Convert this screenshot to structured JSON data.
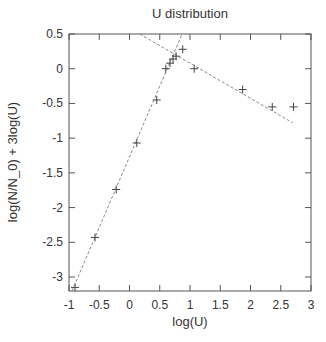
{
  "chart_data": {
    "type": "scatter",
    "title": "U distribution",
    "xlabel": "log(U)",
    "ylabel": "log(N/N_0) + 3log(U)",
    "xlim": [
      -1,
      3
    ],
    "ylim": [
      -3.2,
      0.5
    ],
    "xticks": [
      -1,
      -0.5,
      0,
      0.5,
      1,
      1.5,
      2,
      2.5,
      3
    ],
    "xtick_labels": [
      "-1",
      "-0.5",
      "0",
      "0.5",
      "1",
      "1.5",
      "2",
      "2.5",
      "3"
    ],
    "yticks": [
      0.5,
      0,
      -0.5,
      -1,
      -1.5,
      -2,
      -2.5,
      -3
    ],
    "ytick_labels": [
      "0.5",
      "0",
      "-0.5",
      "-1",
      "-1.5",
      "-2",
      "-2.5",
      "-3"
    ],
    "grid": false,
    "legend": null,
    "series": [
      {
        "name": "data",
        "marker": "+",
        "x": [
          -0.9,
          -0.57,
          -0.22,
          0.12,
          0.45,
          0.6,
          0.67,
          0.72,
          0.77,
          0.88,
          1.07,
          1.87,
          2.36,
          2.71
        ],
        "y": [
          -3.15,
          -2.43,
          -1.74,
          -1.07,
          -0.45,
          0.0,
          0.08,
          0.14,
          0.18,
          0.28,
          0.0,
          -0.3,
          -0.55,
          -0.55
        ]
      },
      {
        "name": "fit-steep",
        "style": "dashed",
        "x": [
          -0.95,
          0.87
        ],
        "y": [
          -3.2,
          0.5
        ]
      },
      {
        "name": "fit-shallow",
        "style": "dashed",
        "x": [
          0.17,
          2.7
        ],
        "y": [
          0.5,
          -0.78
        ]
      }
    ]
  },
  "layout": {
    "plot_left": 69,
    "plot_top": 34,
    "plot_right": 311,
    "plot_bottom": 291
  },
  "colors": {
    "axis": "#555555",
    "marker": "#444444",
    "fit_line": "#888888",
    "text": "#333333"
  }
}
